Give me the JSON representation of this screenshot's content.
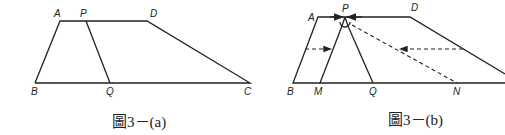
{
  "figure_a": {
    "caption": "圖3－(a)",
    "labels": {
      "A": "A",
      "P": "P",
      "D": "D",
      "B": "B",
      "Q": "Q",
      "C": "C"
    }
  },
  "figure_b": {
    "caption": "圖3－(b)",
    "labels": {
      "A": "A",
      "P": "P",
      "D": "D",
      "B": "B",
      "M": "M",
      "Q": "Q",
      "N": "N"
    }
  }
}
